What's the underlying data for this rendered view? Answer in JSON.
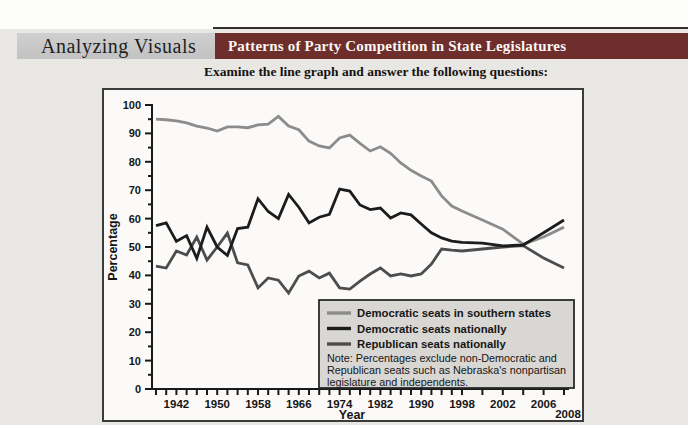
{
  "header": {
    "kicker": "Analyzing Visuals",
    "title": "Patterns of Party Competition in State Legislatures",
    "instruction": "Examine the line graph and answer the following questions:"
  },
  "chart_data": {
    "type": "line",
    "title": "Patterns of Party Competition in State Legislatures",
    "xlabel": "Year",
    "ylabel": "Percentage",
    "ylim": [
      0,
      100
    ],
    "ytick_step": 10,
    "ytick_minor_step": 5,
    "xtick_minor_step_years": 2,
    "x_axis_note": "axis compressed before 1998; tick spacing doubles after 1998",
    "x_tick_labels": [
      "1942",
      "1950",
      "1958",
      "1966",
      "1974",
      "1982",
      "1990",
      "1998",
      "2002",
      "2006"
    ],
    "x_end_label": "2008",
    "years": [
      1938,
      1940,
      1942,
      1944,
      1946,
      1948,
      1950,
      1952,
      1954,
      1956,
      1958,
      1960,
      1962,
      1964,
      1966,
      1968,
      1970,
      1972,
      1974,
      1976,
      1978,
      1980,
      1982,
      1984,
      1986,
      1988,
      1990,
      1992,
      1994,
      1996,
      1998,
      2000,
      2002,
      2004,
      2006,
      2008
    ],
    "series": [
      {
        "name": "Democratic seats in southern states",
        "color": "#8c8c8c",
        "values": [
          95,
          94.8,
          94.4,
          93.7,
          92.6,
          91.9,
          90.8,
          92.3,
          92.3,
          92,
          93,
          93.3,
          96,
          92.6,
          91.3,
          87.3,
          85.6,
          84.9,
          88.4,
          89.4,
          86.5,
          83.8,
          85.3,
          83,
          79.6,
          77,
          75,
          73.2,
          68,
          64.4,
          62.7,
          59.5,
          56.3,
          51,
          53.5,
          57
        ]
      },
      {
        "name": "Democratic seats nationally",
        "color": "#1c1c1c",
        "values": [
          57.5,
          58.5,
          52,
          54,
          46,
          57,
          50,
          47,
          56.5,
          57,
          67,
          62.5,
          60,
          68.5,
          64,
          58.5,
          60.5,
          61.5,
          70.4,
          69.7,
          64.8,
          63.2,
          63.7,
          60.2,
          62,
          61.3,
          58.1,
          55,
          53.2,
          52.1,
          51.6,
          51.4,
          50.4,
          50.7,
          55,
          59.5
        ]
      },
      {
        "name": "Republican seats nationally",
        "color": "#4d4d4d",
        "values": [
          43.3,
          42.6,
          48.6,
          47.2,
          53.5,
          45.4,
          50,
          54.9,
          44.4,
          43.7,
          35.6,
          39.1,
          38.3,
          33.8,
          39.8,
          41.5,
          39.1,
          40.8,
          35.6,
          35.2,
          38,
          40.5,
          42.6,
          39.8,
          40.5,
          39.8,
          40.5,
          44,
          49.3,
          48.9,
          48.6,
          49.3,
          50,
          50.5,
          46.1,
          42.6
        ]
      }
    ],
    "legend": {
      "position": "bottom-right",
      "note_lines": [
        "Note: Percentages exclude non-Democratic and",
        "Republican seats such as Nebraska's nonpartisan",
        "legislature and independents."
      ]
    }
  }
}
